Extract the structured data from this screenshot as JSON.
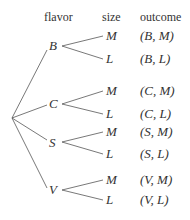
{
  "headers": {
    "flavor": "flavor",
    "size": "size",
    "outcome": "outcome"
  },
  "flavors": [
    {
      "label": "B",
      "sizes": [
        "M",
        "L"
      ],
      "outcomes": [
        [
          "B",
          "M"
        ],
        [
          "B",
          "L"
        ]
      ]
    },
    {
      "label": "C",
      "sizes": [
        "M",
        "L"
      ],
      "outcomes": [
        [
          "C",
          "M"
        ],
        [
          "C",
          "L"
        ]
      ]
    },
    {
      "label": "S",
      "sizes": [
        "M",
        "L"
      ],
      "outcomes": [
        [
          "S",
          "M"
        ],
        [
          "S",
          "L"
        ]
      ]
    },
    {
      "label": "V",
      "sizes": [
        "M",
        "L"
      ],
      "outcomes": [
        [
          "V",
          "M"
        ],
        [
          "V",
          "L"
        ]
      ]
    }
  ],
  "outcome_text": {
    "b_m": "(B, M)",
    "b_l": "(B, L)",
    "c_m": "(C, M)",
    "c_l": "(C, L)",
    "s_m": "(S, M)",
    "s_l": "(S, L)",
    "v_m": "(V, M)",
    "v_l": "(V, L)"
  },
  "colors": {
    "line": "#555555",
    "text": "#333333"
  }
}
